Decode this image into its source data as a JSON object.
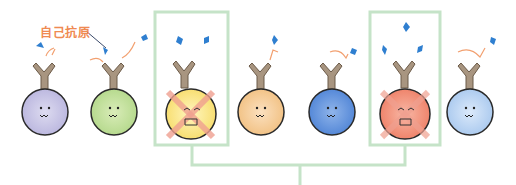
{
  "annotation": {
    "label": "自己抗原",
    "color": "#ef8a52"
  },
  "colors": {
    "antigen": "#2f7fd0",
    "receptor": "#a89580",
    "receptor_outline": "#6b5a48",
    "bracket": "#c5e3c8",
    "cross": "#f0a090",
    "arrow": "#f2a070",
    "outline": "#2a2a2a"
  },
  "cells": [
    {
      "id": 1,
      "color": "#c9c6e6",
      "state": "normal",
      "highlighted": false
    },
    {
      "id": 2,
      "color": "#c7e3a3",
      "state": "normal",
      "highlighted": false
    },
    {
      "id": 3,
      "color": "#f8e590",
      "state": "autoreactive",
      "highlighted": true
    },
    {
      "id": 4,
      "color": "#f6cf9f",
      "state": "normal",
      "highlighted": false
    },
    {
      "id": 5,
      "color": "#6d9be0",
      "state": "normal",
      "highlighted": false
    },
    {
      "id": 6,
      "color": "#f39a84",
      "state": "autoreactive",
      "highlighted": true
    },
    {
      "id": 7,
      "color": "#c5dcf5",
      "state": "normal",
      "highlighted": false
    }
  ]
}
